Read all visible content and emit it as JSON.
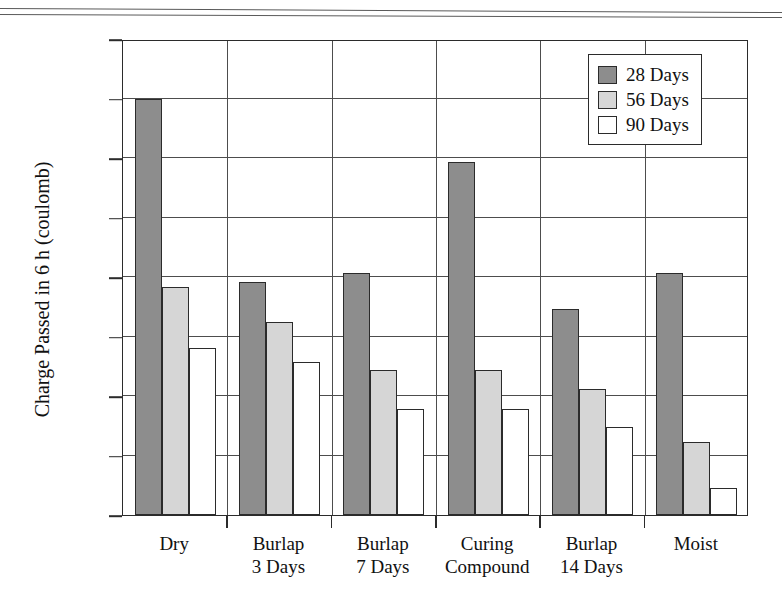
{
  "chart_data": {
    "type": "bar",
    "title": "",
    "subtitle": "",
    "xlabel": "",
    "ylabel": "Charge Passed in 6 h (coulomb)",
    "categories": [
      "Dry",
      "Burlap\n3 Days",
      "Burlap\n7 Days",
      "Curing\nCompound",
      "Burlap\n14 Days",
      "Moist"
    ],
    "series": [
      {
        "name": "28 Days",
        "color": "#8d8d8d",
        "values": [
          3500,
          1960,
          2030,
          2970,
          1730,
          2030
        ]
      },
      {
        "name": "56 Days",
        "color": "#d6d6d6",
        "values": [
          1920,
          1620,
          1220,
          1220,
          1060,
          610
        ]
      },
      {
        "name": "90 Days",
        "color": "#ffffff",
        "values": [
          1400,
          1290,
          890,
          890,
          740,
          230
        ]
      }
    ],
    "ylim": [
      0,
      4000
    ],
    "yticks": [
      0,
      500,
      1000,
      1500,
      2000,
      2500,
      3000,
      3500,
      4000
    ],
    "ytick_labels": [
      "0",
      "500",
      "1000",
      "1500",
      "2000",
      "2500",
      "3000",
      "3500",
      "4000"
    ],
    "grid": "horizontal-and-vertical",
    "legend_position": "top-right",
    "legend_entries": [
      "28 Days",
      "56 Days",
      "90 Days"
    ]
  },
  "legend": {
    "items": [
      {
        "label": "28 Days"
      },
      {
        "label": "56 Days"
      },
      {
        "label": "90 Days"
      }
    ]
  },
  "axes": {
    "y_title": "Charge Passed in 6 h (coulomb)"
  },
  "colors": {
    "series_28_days": "#8d8d8d",
    "series_56_days": "#d6d6d6",
    "series_90_days": "#ffffff",
    "axis": "#2b2b2b",
    "grid": "#4d4d4d",
    "background": "#ffffff"
  }
}
